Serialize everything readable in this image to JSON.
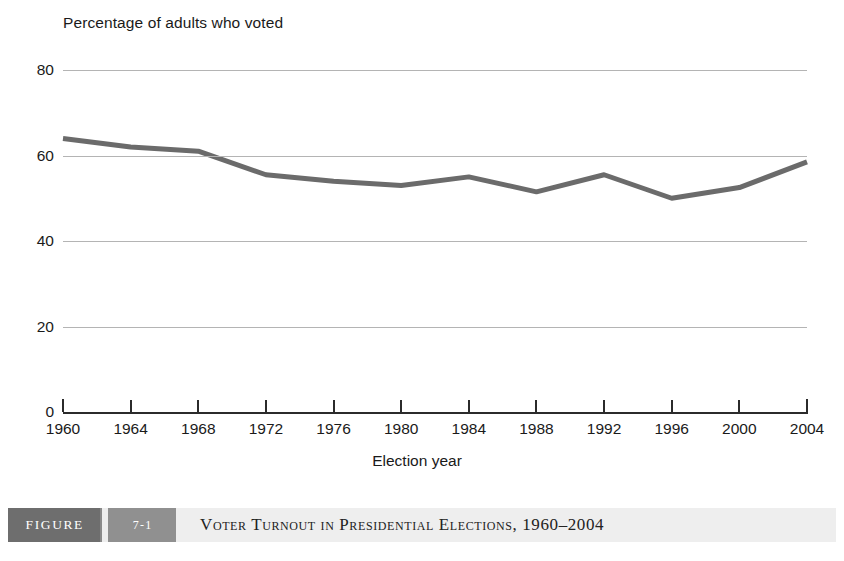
{
  "chart_data": {
    "type": "line",
    "title": "",
    "ylabel": "Percentage of adults who voted",
    "xlabel": "Election year",
    "categories": [
      "1960",
      "1964",
      "1968",
      "1972",
      "1976",
      "1980",
      "1984",
      "1988",
      "1992",
      "1996",
      "2000",
      "2004"
    ],
    "x": [
      1960,
      1964,
      1968,
      1972,
      1976,
      1980,
      1984,
      1988,
      1992,
      1996,
      2000,
      2004
    ],
    "values": [
      64.0,
      62.0,
      61.0,
      55.5,
      54.0,
      53.0,
      55.0,
      51.5,
      55.5,
      50.0,
      52.5,
      58.5
    ],
    "series": [
      {
        "name": "Percentage of adults who voted",
        "values": [
          64.0,
          62.0,
          61.0,
          55.5,
          54.0,
          53.0,
          55.0,
          51.5,
          55.5,
          50.0,
          52.5,
          58.5
        ]
      }
    ],
    "ylim": [
      0,
      80
    ],
    "yticks": [
      0,
      20,
      40,
      60,
      80
    ],
    "ytick_labels": [
      "0",
      "20",
      "40",
      "60",
      "80"
    ],
    "xlim": [
      1960,
      2004
    ],
    "grid": "horizontal",
    "legend": "none",
    "line_color": "#6b6b6b",
    "grid_color": "#b4b4b4",
    "axis_color": "#2b2b2b"
  },
  "caption": {
    "figure_label": "FIGURE",
    "figure_number": "7-1",
    "title": "Voter Turnout in Presidential Elections, 1960–2004"
  }
}
